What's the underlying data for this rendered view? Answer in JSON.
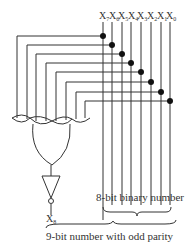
{
  "diagram": {
    "input_labels": [
      "X7",
      "X6",
      "X5",
      "X4",
      "X3",
      "X2",
      "X1",
      "X0"
    ],
    "input_label_parts": [
      {
        "base": "X",
        "sub": "7"
      },
      {
        "base": "X",
        "sub": "6"
      },
      {
        "base": "X",
        "sub": "5"
      },
      {
        "base": "X",
        "sub": "4"
      },
      {
        "base": "X",
        "sub": "3"
      },
      {
        "base": "X",
        "sub": "2"
      },
      {
        "base": "X",
        "sub": "1"
      },
      {
        "base": "X",
        "sub": "0"
      }
    ],
    "output_label": {
      "base": "X",
      "sub": "8"
    },
    "brace_8bit_label": "8-bit binary number",
    "brace_9bit_label": "9-bit number with odd parity",
    "gates": [
      "8-input XOR gate",
      "NOT gate (inverter)"
    ],
    "colors": {
      "line": "#333333",
      "dot": "#111111",
      "text": "#333333"
    }
  }
}
